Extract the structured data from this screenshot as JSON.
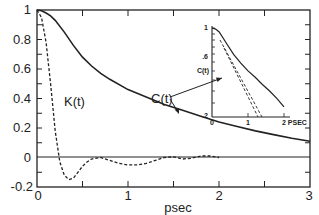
{
  "chart_data": [
    {
      "type": "line",
      "role": "main",
      "title": "",
      "xlabel": "psec",
      "ylabel": "",
      "xlim": [
        0,
        3
      ],
      "ylim": [
        -0.2,
        1.0
      ],
      "x_ticks": [
        0,
        1,
        2,
        3
      ],
      "x_tick_labels": [
        "0",
        "1",
        "2",
        "3"
      ],
      "y_ticks": [
        -0.2,
        0,
        0.2,
        0.4,
        0.6,
        0.8,
        1.0
      ],
      "y_tick_labels": [
        "-0.2",
        "0",
        "0.2",
        "0.4",
        "0.6",
        "0.8",
        "1"
      ],
      "grid": false,
      "legend": "none (curves labeled directly)",
      "zero_line": true,
      "series": [
        {
          "name": "C(t)",
          "style": "solid",
          "x": [
            0,
            0.05,
            0.1,
            0.15,
            0.2,
            0.3,
            0.4,
            0.5,
            0.6,
            0.7,
            0.8,
            1.0,
            1.2,
            1.4,
            1.6,
            1.8,
            2.0,
            2.2,
            2.4,
            2.6,
            2.8,
            3.0
          ],
          "values": [
            1.0,
            0.995,
            0.98,
            0.96,
            0.93,
            0.85,
            0.76,
            0.68,
            0.62,
            0.57,
            0.53,
            0.46,
            0.41,
            0.36,
            0.32,
            0.28,
            0.24,
            0.21,
            0.18,
            0.155,
            0.13,
            0.11
          ]
        },
        {
          "name": "K(t)",
          "style": "dashed",
          "x": [
            0,
            0.05,
            0.1,
            0.15,
            0.2,
            0.25,
            0.3,
            0.35,
            0.4,
            0.45,
            0.5,
            0.55,
            0.6,
            0.7,
            0.8,
            0.9,
            1.0,
            1.1,
            1.2,
            1.3,
            1.4,
            1.5,
            1.6,
            1.7,
            1.8,
            1.9,
            2.0
          ],
          "values": [
            1.0,
            0.95,
            0.78,
            0.5,
            0.18,
            -0.03,
            -0.12,
            -0.15,
            -0.14,
            -0.1,
            -0.06,
            -0.03,
            -0.01,
            0.0,
            -0.02,
            -0.04,
            -0.05,
            -0.05,
            -0.04,
            -0.02,
            0.0,
            0.005,
            -0.01,
            -0.005,
            0.01,
            0.01,
            0.0
          ]
        }
      ],
      "annotations": [
        {
          "text": "K(t)",
          "x": 0.28,
          "y": 0.38
        },
        {
          "text": "C(t)",
          "x": 1.05,
          "y": 0.37,
          "arrows_to": [
            "main C(t) curve",
            "inset C(t) curve"
          ]
        }
      ]
    },
    {
      "type": "line",
      "role": "inset",
      "xlabel": "PSEC",
      "ylabel": "C(t)",
      "xlim": [
        0,
        2.2
      ],
      "ylim": [
        0.2,
        1.0
      ],
      "y_scale": "log",
      "x_ticks": [
        0,
        1,
        2
      ],
      "x_tick_labels": [
        "0",
        "1",
        "2 PSEC"
      ],
      "y_tick_labels": [
        "1",
        ".6",
        ".2"
      ],
      "series": [
        {
          "name": "C(t)",
          "style": "solid",
          "x": [
            0,
            0.1,
            0.2,
            0.4,
            0.6,
            0.8,
            1.0,
            1.2,
            1.4,
            1.6,
            1.8,
            2.0
          ],
          "values": [
            1.0,
            0.98,
            0.93,
            0.76,
            0.62,
            0.53,
            0.46,
            0.41,
            0.36,
            0.32,
            0.28,
            0.24
          ]
        },
        {
          "name": "exponential fit (upper)",
          "style": "dashed",
          "x": [
            0.3,
            1.35
          ],
          "values": [
            0.8,
            0.2
          ]
        },
        {
          "name": "exponential fit (lower)",
          "style": "dashed",
          "x": [
            0.4,
            1.3
          ],
          "values": [
            0.74,
            0.2
          ]
        }
      ]
    }
  ],
  "main": {
    "xlabel": "psec",
    "x_tick_labels": [
      "0",
      "1",
      "2",
      "3"
    ],
    "y_tick_labels": [
      "-0.2",
      "0",
      "0.2",
      "0.4",
      "0.6",
      "0.8",
      "1"
    ],
    "k_label": "K(t)",
    "c_label": "C(t)"
  },
  "inset": {
    "ylabel": "C(t)",
    "y_tick_labels": [
      "1",
      ".6",
      ".2"
    ],
    "x_tick_labels": [
      "0",
      "1",
      "2 PSEC"
    ]
  },
  "colors": {
    "ink": "#222222",
    "background": "#ffffff"
  }
}
